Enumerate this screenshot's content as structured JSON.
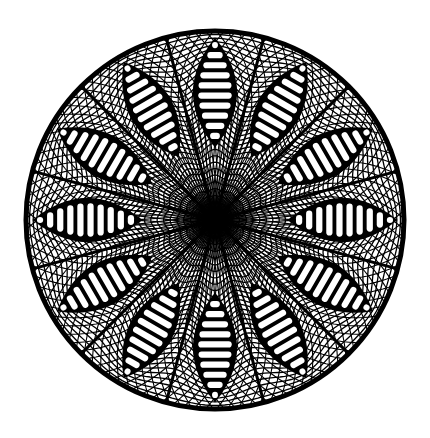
{
  "image": {
    "description": "Black and white geometric string-art mandala with 12 ladder petals",
    "width": 430,
    "height": 438,
    "background": "#ffffff",
    "ink": "#000000"
  },
  "mandala": {
    "center": [
      215,
      220
    ],
    "radius": 189,
    "rim_stroke": 5,
    "petal_count": 12,
    "petal_start_angle_deg": 0,
    "petal_outer_r": 181,
    "petal_inner_r": 74,
    "petal_half_width": 21,
    "petal_slots": 10,
    "mesh_rings": 34,
    "mesh_spokes_per_sector": 9,
    "hub_radius": 12
  }
}
